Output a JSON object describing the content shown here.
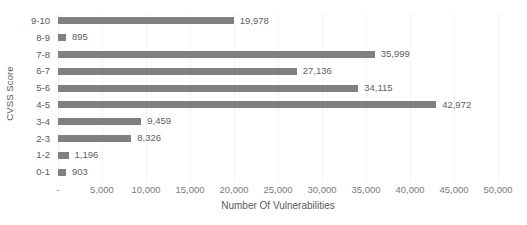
{
  "chart_data": {
    "type": "bar",
    "orientation": "horizontal",
    "title": "",
    "xlabel": "Number Of Vulnerabilities",
    "ylabel": "CVSS Score",
    "categories": [
      "0-1",
      "1-2",
      "2-3",
      "3-4",
      "4-5",
      "5-6",
      "6-7",
      "7-8",
      "8-9",
      "9-10"
    ],
    "values": [
      903,
      1196,
      8326,
      9459,
      42972,
      34115,
      27136,
      35999,
      895,
      19978
    ],
    "data_labels": [
      "903",
      "1,196",
      "8,326",
      "9,459",
      "42,972",
      "34,115",
      "27,136",
      "35,999",
      "895",
      "19,978"
    ],
    "xlim": [
      0,
      50000
    ],
    "ylim": null,
    "xticks": [
      0,
      5000,
      10000,
      15000,
      20000,
      25000,
      30000,
      35000,
      40000,
      45000,
      50000
    ],
    "xticklabels": [
      "-",
      "5,000",
      "10,000",
      "15,000",
      "20,000",
      "25,000",
      "30,000",
      "35,000",
      "40,000",
      "45,000",
      "50,000"
    ],
    "grid": "vertical",
    "legend": null,
    "bar_color": "#808080",
    "gridline_color": "#f2f2f2",
    "label_color": "#595959",
    "tick_color": "#7a7a7a"
  }
}
